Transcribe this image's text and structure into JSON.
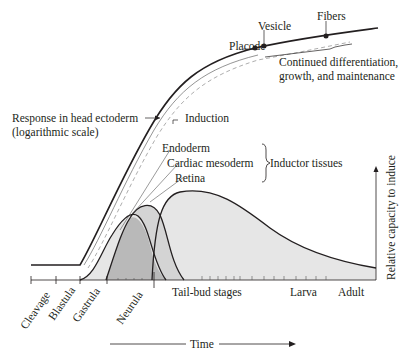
{
  "diagram": {
    "title": "",
    "colors": {
      "curve": "#231f20",
      "fill_light": "#e6e6e6",
      "fill_mid": "#d4d4d4",
      "fill_overlap": "#b9b9b9",
      "dashed": "#8a8a8a"
    },
    "labels": {
      "response_line1": "Response in head ectoderm",
      "response_line2": "(logarithmic scale)",
      "induction": "Induction",
      "placode": "Placode",
      "vesicle": "Vesicle",
      "fibers": "Fibers",
      "continued_line1": "Continued differentiation,",
      "continued_line2": "growth, and maintenance",
      "endoderm": "Endoderm",
      "cardiac_mesoderm": "Cardiac mesoderm",
      "retina": "Retina",
      "inductor_tissues": "Inductor tissues",
      "y_axis": "Relative capacity to induce",
      "time_axis": "Time"
    },
    "stages": {
      "cleavage": "Cleavage",
      "blastula": "Blastula",
      "gastrula": "Gastrula",
      "neurula": "Neurula",
      "tailbud": "Tail-bud stages",
      "larva": "Larva",
      "adult": "Adult"
    }
  }
}
